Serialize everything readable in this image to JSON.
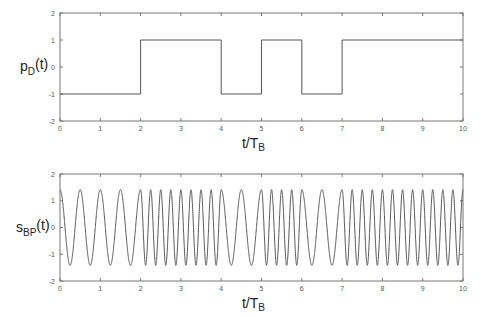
{
  "chart_data": [
    {
      "type": "line",
      "name": "baseband-data-signal",
      "ylabel": "p",
      "ylabel_sub": "D",
      "ylabel_suffix": "(t)",
      "xlabel": "t/T",
      "xlabel_sub": "B",
      "xlim": [
        0,
        10
      ],
      "ylim": [
        -2,
        2
      ],
      "xticks": [
        0,
        1,
        2,
        3,
        4,
        5,
        6,
        7,
        8,
        9,
        10
      ],
      "yticks": [
        -2,
        -1,
        0,
        1,
        2
      ],
      "grid": false,
      "series": [
        {
          "name": "p_D(t)",
          "step": true,
          "bits_per_TB": [
            -1,
            -1,
            1,
            1,
            -1,
            1,
            -1,
            1,
            1,
            1
          ],
          "x": [
            0,
            2,
            2,
            4,
            4,
            5,
            5,
            6,
            6,
            7,
            7,
            10
          ],
          "y": [
            -1,
            -1,
            1,
            1,
            -1,
            -1,
            1,
            1,
            -1,
            -1,
            1,
            1
          ]
        }
      ],
      "box_px": {
        "left": 60,
        "right": 463,
        "top": 13,
        "bottom": 121
      }
    },
    {
      "type": "line",
      "name": "fsk-bandpass-signal",
      "ylabel": "s",
      "ylabel_sub": "BP",
      "ylabel_suffix": "(t)",
      "xlabel": "t/T",
      "xlabel_sub": "B",
      "xlim": [
        0,
        10
      ],
      "ylim": [
        -2,
        2
      ],
      "xticks": [
        0,
        1,
        2,
        3,
        4,
        5,
        6,
        7,
        8,
        9,
        10
      ],
      "yticks": [
        -2,
        -1,
        0,
        1,
        2
      ],
      "grid": false,
      "series": [
        {
          "name": "s_BP(t)",
          "amplitude": 1.414,
          "cycles_per_TB_when_minus1": 2,
          "cycles_per_TB_when_plus1": 4,
          "modulated_by": "p_D(t)",
          "modulation": "FSK (continuous phase)"
        }
      ],
      "box_px": {
        "left": 60,
        "right": 463,
        "top": 174,
        "bottom": 281
      }
    }
  ]
}
